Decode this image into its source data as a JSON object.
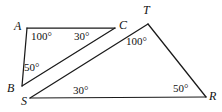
{
  "figure": {
    "background_color": "#ffffff",
    "stroke_color": "#1a1a1a",
    "width": 222,
    "height": 112
  },
  "vertices": [
    {
      "name": "A",
      "label": "A",
      "x": 27,
      "y": 28,
      "label_x": 14,
      "label_y": 20
    },
    {
      "name": "C",
      "label": "C",
      "x": 115,
      "y": 28,
      "label_x": 119,
      "label_y": 19
    },
    {
      "name": "T",
      "label": "T",
      "x": 148,
      "y": 24,
      "label_x": 143,
      "label_y": 4
    },
    {
      "name": "B",
      "label": "B",
      "x": 22,
      "y": 86,
      "label_x": 7,
      "label_y": 82
    },
    {
      "name": "S",
      "label": "S",
      "x": 30,
      "y": 98,
      "label_x": 21,
      "label_y": 95
    },
    {
      "name": "R",
      "label": "R",
      "x": 206,
      "y": 97,
      "label_x": 209,
      "label_y": 90
    }
  ],
  "segments": [
    {
      "name": "segment-AC",
      "from": "A",
      "to": "C"
    },
    {
      "name": "segment-AB",
      "from": "A",
      "to": "B"
    },
    {
      "name": "segment-BC",
      "from": "B",
      "to": "C"
    },
    {
      "name": "segment-ST",
      "from": "S",
      "to": "T"
    },
    {
      "name": "segment-TR",
      "from": "T",
      "to": "R"
    },
    {
      "name": "segment-SR",
      "from": "S",
      "to": "R"
    }
  ],
  "angle_labels": [
    {
      "name": "angle-at-A",
      "vertex": "A",
      "text": "100°",
      "x": 31,
      "y": 31
    },
    {
      "name": "angle-at-C",
      "vertex": "C",
      "text": "30°",
      "x": 74,
      "y": 31
    },
    {
      "name": "angle-at-B",
      "vertex": "B",
      "text": "50°",
      "x": 24,
      "y": 62
    },
    {
      "name": "angle-at-T",
      "vertex": "T",
      "text": "100°",
      "x": 126,
      "y": 36
    },
    {
      "name": "angle-at-S",
      "vertex": "S",
      "text": "30°",
      "x": 73,
      "y": 85
    },
    {
      "name": "angle-at-R",
      "vertex": "R",
      "text": "50°",
      "x": 173,
      "y": 83
    }
  ]
}
